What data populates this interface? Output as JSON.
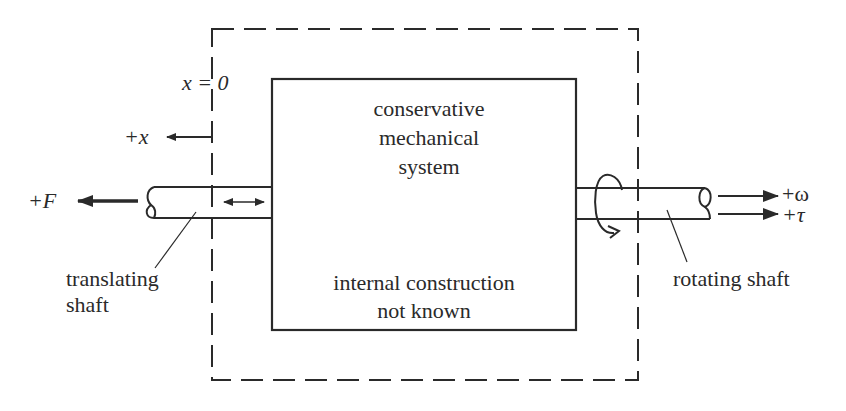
{
  "diagram": {
    "boundary_box": {
      "style": "dashed",
      "label": ""
    },
    "system_box": {
      "title_lines": [
        "conservative",
        "mechanical",
        "system"
      ],
      "note_lines": [
        "internal construction",
        "not known"
      ]
    },
    "origin_label": "x = 0",
    "x_axis": {
      "label": "+x",
      "direction": "left"
    },
    "left_port": {
      "force_label": "+F",
      "force_direction": "left",
      "shaft_label_lines": [
        "translating",
        "shaft"
      ],
      "motion_indicator": "double-headed-arrow"
    },
    "right_port": {
      "omega_label": "+ω",
      "torque_label": "+τ",
      "direction": "right",
      "shaft_label": "rotating shaft",
      "motion_indicator": "curved-rotation-arrow"
    },
    "colors": {
      "ink": "#2a2a2a",
      "background": "#ffffff"
    }
  }
}
